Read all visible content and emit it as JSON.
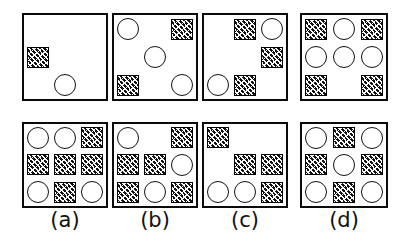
{
  "figure": {
    "kind": "visual-reasoning-matrix",
    "background_color": "#ffffff",
    "ink_color": "#111111",
    "token_types": {
      "circle": "open-circle",
      "square": "crosshatched-square",
      "empty": "blank-cell"
    },
    "top_row_label": "",
    "panels": [
      {
        "id": "problem-1",
        "row": "top",
        "index": 0,
        "caption": "",
        "x": 22,
        "y": 13,
        "w": 86,
        "h": 88,
        "cells": [
          [
            "empty",
            "empty",
            "empty"
          ],
          [
            "square",
            "empty",
            "empty"
          ],
          [
            "empty",
            "circle",
            "empty"
          ]
        ]
      },
      {
        "id": "problem-2",
        "row": "top",
        "index": 1,
        "caption": "",
        "x": 112,
        "y": 13,
        "w": 86,
        "h": 88,
        "cells": [
          [
            "circle",
            "empty",
            "square"
          ],
          [
            "empty",
            "circle",
            "empty"
          ],
          [
            "square",
            "empty",
            "circle"
          ]
        ]
      },
      {
        "id": "problem-3",
        "row": "top",
        "index": 2,
        "caption": "",
        "x": 202,
        "y": 13,
        "w": 86,
        "h": 88,
        "cells": [
          [
            "empty",
            "square",
            "circle"
          ],
          [
            "empty",
            "empty",
            "square"
          ],
          [
            "circle",
            "square",
            "empty"
          ]
        ]
      },
      {
        "id": "problem-4",
        "row": "top",
        "index": 3,
        "caption": "",
        "x": 300,
        "y": 13,
        "w": 88,
        "h": 88,
        "cells": [
          [
            "square",
            "circle",
            "square"
          ],
          [
            "circle",
            "circle",
            "circle"
          ],
          [
            "square",
            "empty",
            "square"
          ]
        ]
      },
      {
        "id": "option-a",
        "row": "bottom",
        "index": 0,
        "caption": "(a)",
        "x": 22,
        "y": 122,
        "w": 86,
        "h": 86,
        "cells": [
          [
            "circle",
            "circle",
            "square"
          ],
          [
            "square",
            "square",
            "square"
          ],
          [
            "circle",
            "square",
            "circle"
          ]
        ]
      },
      {
        "id": "option-b",
        "row": "bottom",
        "index": 1,
        "caption": "(b)",
        "x": 112,
        "y": 122,
        "w": 86,
        "h": 86,
        "cells": [
          [
            "circle",
            "empty",
            "square"
          ],
          [
            "square",
            "square",
            "circle"
          ],
          [
            "square",
            "circle",
            "square"
          ]
        ]
      },
      {
        "id": "option-c",
        "row": "bottom",
        "index": 2,
        "caption": "(c)",
        "x": 202,
        "y": 122,
        "w": 86,
        "h": 86,
        "cells": [
          [
            "square",
            "empty",
            "empty"
          ],
          [
            "empty",
            "square",
            "square"
          ],
          [
            "circle",
            "circle",
            "square"
          ]
        ]
      },
      {
        "id": "option-d",
        "row": "bottom",
        "index": 3,
        "caption": "(d)",
        "x": 300,
        "y": 122,
        "w": 88,
        "h": 86,
        "cells": [
          [
            "circle",
            "square",
            "circle"
          ],
          [
            "square",
            "circle",
            "square"
          ],
          [
            "circle",
            "square",
            "circle"
          ]
        ]
      }
    ],
    "captions": [
      {
        "text": "(a)",
        "x": 22,
        "w": 86,
        "y": 210
      },
      {
        "text": "(b)",
        "x": 112,
        "w": 86,
        "y": 210
      },
      {
        "text": "(c)",
        "x": 202,
        "w": 86,
        "y": 210
      },
      {
        "text": "(d)",
        "x": 300,
        "w": 88,
        "y": 210
      }
    ]
  }
}
